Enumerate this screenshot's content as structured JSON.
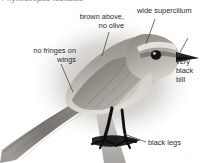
{
  "plate": {
    "title": "Phylloscopus fuscatus",
    "background_color": "#ffffff",
    "width": 208,
    "height": 163
  },
  "subject": {
    "name": "dusky-warbler",
    "description": "Grayscale illustration of a small warbler perched on a branch, facing right",
    "body_color": "#9a948d",
    "bill_color": "#2a2a2a",
    "leg_color": "#111111",
    "eye_color": "#1a1a1a",
    "supercilium_color": "#e6e2dc"
  },
  "annotations": [
    {
      "id": "brown-above",
      "text": "brown above,\nno olive",
      "align": "right"
    },
    {
      "id": "wide-supercilium",
      "text": "wide supercilium",
      "align": "left"
    },
    {
      "id": "no-fringes",
      "text": "no fringes on\nwings",
      "align": "right"
    },
    {
      "id": "very-black-bill",
      "text": "very\nblack\nbill",
      "align": "left"
    },
    {
      "id": "black-legs",
      "text": "black legs",
      "align": "left"
    }
  ],
  "leader_line_color": "#4a4a4a"
}
